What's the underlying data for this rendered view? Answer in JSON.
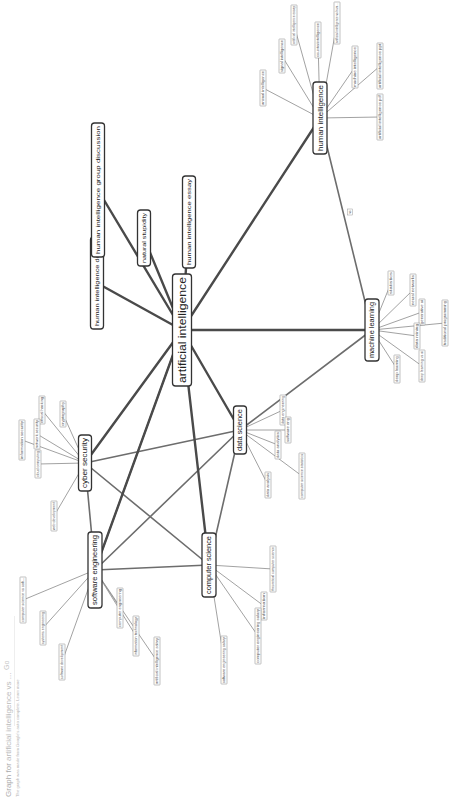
{
  "header": {
    "title_prefix": "Graph for",
    "query": "artificial intelligence vs ...",
    "go_label": "Go",
    "subtitle": "The graph was made from Google's auto complete. Learn more"
  },
  "graph": {
    "center": {
      "id": "ai",
      "label": "artificial intelligence",
      "x": 182,
      "y": 330,
      "w": 19,
      "h": 112,
      "size": 11
    },
    "hubs": [
      {
        "id": "hi",
        "label": "human intelligence",
        "x": 320,
        "y": 118,
        "w": 14,
        "h": 72,
        "size": 7
      },
      {
        "id": "ml",
        "label": "machine learning",
        "x": 372,
        "y": 330,
        "w": 14,
        "h": 62,
        "size": 6.5
      },
      {
        "id": "ds",
        "label": "data science",
        "x": 240,
        "y": 430,
        "w": 13,
        "h": 48,
        "size": 6.5
      },
      {
        "id": "cy",
        "label": "cyber security",
        "x": 85,
        "y": 463,
        "w": 13,
        "h": 56,
        "size": 6.5
      },
      {
        "id": "se",
        "label": "software engineering",
        "x": 95,
        "y": 570,
        "w": 14,
        "h": 76,
        "size": 6.5
      },
      {
        "id": "cs",
        "label": "computer science",
        "x": 209,
        "y": 565,
        "w": 14,
        "h": 64,
        "size": 6.5
      },
      {
        "id": "hid",
        "label": "human intelligence debate",
        "x": 97,
        "y": 283,
        "w": 13,
        "h": 92,
        "size": 6
      },
      {
        "id": "higd",
        "label": "human intelligence group discussion",
        "x": 98,
        "y": 190,
        "w": 13,
        "h": 134,
        "size": 6
      },
      {
        "id": "ns",
        "label": "natural stupidity",
        "x": 144,
        "y": 238,
        "w": 13,
        "h": 56,
        "size": 6
      },
      {
        "id": "hie",
        "label": "human intelligence essay",
        "x": 189,
        "y": 222,
        "w": 13,
        "h": 92,
        "size": 6
      }
    ],
    "major_edges": [
      [
        "ai",
        "hi"
      ],
      [
        "ai",
        "ml"
      ],
      [
        "ai",
        "ds"
      ],
      [
        "ai",
        "cy"
      ],
      [
        "ai",
        "se"
      ],
      [
        "ai",
        "cs"
      ],
      [
        "ai",
        "hid"
      ],
      [
        "ai",
        "higd"
      ],
      [
        "ai",
        "ns"
      ],
      [
        "ai",
        "hie"
      ]
    ],
    "mid_edges": [
      [
        "se",
        "cy"
      ],
      [
        "se",
        "ds"
      ],
      [
        "se",
        "cs"
      ],
      [
        "cy",
        "ds"
      ],
      [
        "cy",
        "cs"
      ],
      [
        "ds",
        "cs"
      ],
      [
        "ds",
        "ml"
      ],
      [
        "se",
        "ai"
      ],
      [
        "ml",
        "hi"
      ]
    ],
    "edge_label": {
      "text": "vs",
      "x": 350,
      "y": 212
    },
    "leaves": [
      {
        "hub": "hi",
        "label": "animal intelligence",
        "x": 263,
        "y": 88,
        "h": 36
      },
      {
        "hub": "hi",
        "label": "signal intelligence",
        "x": 282,
        "y": 56,
        "h": 34
      },
      {
        "hub": "hi",
        "label": "artificial intelligence essay",
        "x": 294,
        "y": 25,
        "h": 40
      },
      {
        "hub": "hi",
        "label": "counterintelligence",
        "x": 318,
        "y": 40,
        "h": 36
      },
      {
        "hub": "hi",
        "label": "artificial intelligence vs hum...",
        "x": 337,
        "y": 23,
        "h": 42
      },
      {
        "hub": "hi",
        "label": "machine intelligence",
        "x": 355,
        "y": 67,
        "h": 42
      },
      {
        "hub": "hi",
        "label": "artificial intelligence ppt",
        "x": 380,
        "y": 66,
        "h": 46
      },
      {
        "hub": "hi",
        "label": "artificial intelligence pdf",
        "x": 380,
        "y": 117,
        "h": 46
      },
      {
        "hub": "ml",
        "label": "statistics",
        "x": 391,
        "y": 283,
        "h": 24
      },
      {
        "hub": "ml",
        "label": "neural networks",
        "x": 413,
        "y": 290,
        "h": 32
      },
      {
        "hub": "ml",
        "label": "generative ai",
        "x": 422,
        "y": 312,
        "h": 26
      },
      {
        "hub": "ml",
        "label": "data mining",
        "x": 417,
        "y": 336,
        "h": 26
      },
      {
        "hub": "ml",
        "label": "traditional programming",
        "x": 445,
        "y": 323,
        "h": 46
      },
      {
        "hub": "ml",
        "label": "deep learning",
        "x": 397,
        "y": 369,
        "h": 28
      },
      {
        "hub": "ml",
        "label": "deep learning vs ai",
        "x": 422,
        "y": 366,
        "h": 32
      },
      {
        "hub": "ds",
        "label": "data engineering",
        "x": 283,
        "y": 410,
        "h": 30
      },
      {
        "hub": "ds",
        "label": "software eng",
        "x": 288,
        "y": 430,
        "h": 26
      },
      {
        "hub": "ds",
        "label": "data analytics",
        "x": 278,
        "y": 445,
        "h": 28
      },
      {
        "hub": "ds",
        "label": "data analysis",
        "x": 268,
        "y": 485,
        "h": 26
      },
      {
        "hub": "ds",
        "label": "computer science statistics",
        "x": 302,
        "y": 476,
        "h": 46
      },
      {
        "hub": "cy",
        "label": "information security",
        "x": 22,
        "y": 440,
        "h": 40
      },
      {
        "hub": "cy",
        "label": "ethical hacking",
        "x": 42,
        "y": 410,
        "h": 28
      },
      {
        "hub": "cy",
        "label": "network security",
        "x": 37,
        "y": 434,
        "h": 30
      },
      {
        "hub": "cy",
        "label": "cloud computing",
        "x": 38,
        "y": 464,
        "h": 28
      },
      {
        "hub": "cy",
        "label": "cryptography",
        "x": 63,
        "y": 414,
        "h": 26
      },
      {
        "hub": "cy",
        "label": "web development",
        "x": 54,
        "y": 516,
        "h": 30
      },
      {
        "hub": "se",
        "label": "computer science vs soft...",
        "x": 23,
        "y": 600,
        "h": 46
      },
      {
        "hub": "se",
        "label": "systems engineering",
        "x": 43,
        "y": 628,
        "h": 34
      },
      {
        "hub": "se",
        "label": "software development",
        "x": 62,
        "y": 662,
        "h": 36
      },
      {
        "hub": "se",
        "label": "computer engineering",
        "x": 120,
        "y": 608,
        "h": 40
      },
      {
        "hub": "se",
        "label": "information technology",
        "x": 136,
        "y": 636,
        "h": 40
      },
      {
        "hub": "se",
        "label": "artificial intelligence salary",
        "x": 157,
        "y": 661,
        "h": 48
      },
      {
        "hub": "cs",
        "label": "theoretical computer science",
        "x": 273,
        "y": 569,
        "h": 46
      },
      {
        "hub": "cs",
        "label": "information",
        "x": 264,
        "y": 606,
        "h": 28
      },
      {
        "hub": "cs",
        "label": "computer engineering salary",
        "x": 258,
        "y": 636,
        "h": 56
      },
      {
        "hub": "cs",
        "label": "software engineering salary",
        "x": 224,
        "y": 660,
        "h": 48
      }
    ]
  }
}
